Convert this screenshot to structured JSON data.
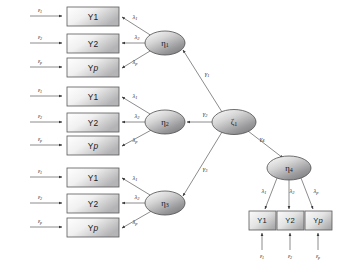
{
  "diagram": {
    "type": "second-order-structural-equation-model",
    "title": "",
    "colors": {
      "box_stroke": "#59595b",
      "ellipse_stroke": "#4d4d4f",
      "path_stroke": "#6e6e70",
      "box_fill_light": "#ffffff",
      "box_fill_dark": "#b9b9bb",
      "ellipse_fill_light": "#f2f2f2",
      "ellipse_fill_dark": "#8f8f91",
      "text": "#1a1a1a",
      "background": "#ffffff"
    },
    "blocks": [
      {
        "factor": "η",
        "factor_sub": "1",
        "indicators": [
          {
            "label": "Y1",
            "plain": "Y",
            "italic": "",
            "suffix": "1",
            "loading": "λ",
            "loading_sub": "1",
            "error": "ε",
            "error_sub": "1"
          },
          {
            "label": "Y2",
            "plain": "Y",
            "italic": "",
            "suffix": "2",
            "loading": "λ",
            "loading_sub": "2",
            "error": "ε",
            "error_sub": "2"
          },
          {
            "label": "Yp",
            "plain": "Y",
            "italic": "p",
            "suffix": "",
            "loading": "λ",
            "loading_sub": "p",
            "error": "ε",
            "error_sub": "p"
          }
        ]
      },
      {
        "factor": "η",
        "factor_sub": "2",
        "indicators": [
          {
            "label": "Y1",
            "plain": "Y",
            "italic": "",
            "suffix": "1",
            "loading": "λ",
            "loading_sub": "1",
            "error": "ε",
            "error_sub": "1"
          },
          {
            "label": "Y2",
            "plain": "Y",
            "italic": "",
            "suffix": "2",
            "loading": "λ",
            "loading_sub": "2",
            "error": "ε",
            "error_sub": "2"
          },
          {
            "label": "Yp",
            "plain": "Y",
            "italic": "p",
            "suffix": "",
            "loading": "λ",
            "loading_sub": "p",
            "error": "ε",
            "error_sub": "p"
          }
        ]
      },
      {
        "factor": "η",
        "factor_sub": "3",
        "indicators": [
          {
            "label": "Y1",
            "plain": "Y",
            "italic": "",
            "suffix": "1",
            "loading": "λ",
            "loading_sub": "1",
            "error": "ε",
            "error_sub": "1"
          },
          {
            "label": "Y2",
            "plain": "Y",
            "italic": "",
            "suffix": "2",
            "loading": "λ",
            "loading_sub": "2",
            "error": "ε",
            "error_sub": "2"
          },
          {
            "label": "Yp",
            "plain": "Y",
            "italic": "p",
            "suffix": "",
            "loading": "λ",
            "loading_sub": "p",
            "error": "ε",
            "error_sub": "p"
          }
        ]
      }
    ],
    "second_order_factor": {
      "factor": "ζ",
      "factor_sub": "1"
    },
    "fourth_factor": {
      "factor": "η",
      "factor_sub": "4",
      "indicators": [
        {
          "label": "Y1",
          "plain": "Y",
          "italic": "",
          "suffix": "1",
          "loading": "λ",
          "loading_sub": "1",
          "error": "ε",
          "error_sub": "1"
        },
        {
          "label": "Y2",
          "plain": "Y",
          "italic": "",
          "suffix": "2",
          "loading": "λ",
          "loading_sub": "2",
          "error": "ε",
          "error_sub": "2"
        },
        {
          "label": "Yp",
          "plain": "Y",
          "italic": "p",
          "suffix": "",
          "loading": "λ",
          "loading_sub": "p",
          "error": "ε",
          "error_sub": "p"
        }
      ]
    },
    "structural_paths": [
      {
        "from": "ζ1",
        "to": "η1",
        "label": "γ",
        "label_sub": "1"
      },
      {
        "from": "ζ1",
        "to": "η2",
        "label": "γ",
        "label_sub": "2"
      },
      {
        "from": "ζ1",
        "to": "η3",
        "label": "γ",
        "label_sub": "3"
      },
      {
        "from": "ζ1",
        "to": "η4",
        "label": "γ",
        "label_sub": "4"
      }
    ]
  }
}
